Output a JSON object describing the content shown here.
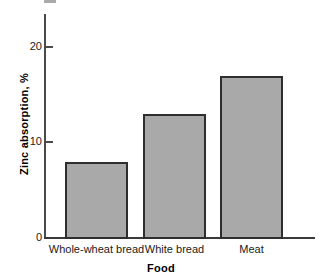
{
  "chart_data": {
    "type": "bar",
    "title": "",
    "categories": [
      "Whole-wheat bread",
      "White bread",
      "Meat"
    ],
    "values": [
      8,
      13,
      17
    ],
    "xlabel": "Food",
    "ylabel": "Zinc absorption, %",
    "ylim": [
      0,
      22
    ],
    "yticks": [
      0,
      10,
      20
    ],
    "ytick_labels": [
      "0",
      "10",
      "20"
    ],
    "grid": false,
    "legend": null,
    "series": [
      {
        "name": "Zinc absorption",
        "values": [
          8,
          13,
          17
        ]
      }
    ],
    "colors": {
      "bar_fill": "#a9a9a9",
      "bar_border": "#2e2e2e",
      "axis": "#3a3a3a",
      "text": "#1a1a1a",
      "background": "#ffffff"
    }
  }
}
